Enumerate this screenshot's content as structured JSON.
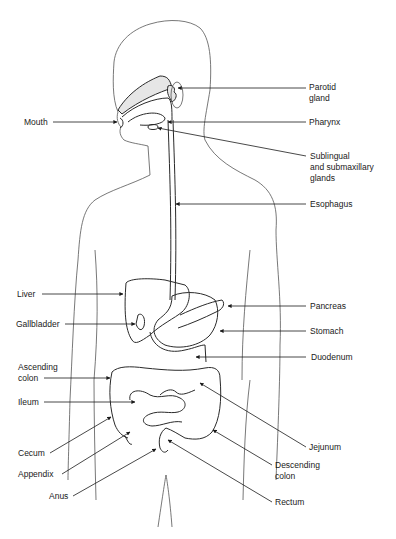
{
  "figure": {
    "labels": [
      {
        "id": "parotid-gland",
        "text": "Parotid\ngland",
        "side": "right"
      },
      {
        "id": "mouth",
        "text": "Mouth",
        "side": "left"
      },
      {
        "id": "pharynx",
        "text": "Pharynx",
        "side": "right"
      },
      {
        "id": "sublingual-submaxillary-glands",
        "text": "Sublingual\nand submaxillary\nglands",
        "side": "right"
      },
      {
        "id": "esophagus",
        "text": "Esophagus",
        "side": "right"
      },
      {
        "id": "liver",
        "text": "Liver",
        "side": "left"
      },
      {
        "id": "pancreas",
        "text": "Pancreas",
        "side": "right"
      },
      {
        "id": "gallbladder",
        "text": "Gallbladder",
        "side": "left"
      },
      {
        "id": "stomach",
        "text": "Stomach",
        "side": "right"
      },
      {
        "id": "duodenum",
        "text": "Duodenum",
        "side": "right"
      },
      {
        "id": "ascending-colon",
        "text": "Ascending\ncolon",
        "side": "left"
      },
      {
        "id": "ileum",
        "text": "Ileum",
        "side": "left"
      },
      {
        "id": "cecum",
        "text": "Cecum",
        "side": "left"
      },
      {
        "id": "appendix",
        "text": "Appendix",
        "side": "left"
      },
      {
        "id": "jejunum",
        "text": "Jejunum",
        "side": "right"
      },
      {
        "id": "descending-colon",
        "text": "Descending\ncolon",
        "side": "right"
      },
      {
        "id": "anus",
        "text": "Anus",
        "side": "left"
      },
      {
        "id": "rectum",
        "text": "Rectum",
        "side": "right"
      }
    ]
  }
}
